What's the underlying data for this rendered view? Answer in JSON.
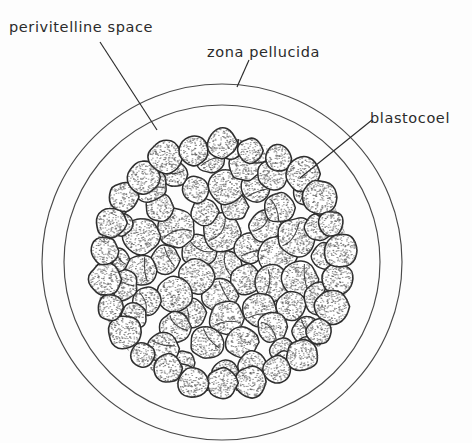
{
  "figure": {
    "background_color": "#fdfdfd",
    "ink_color": "#2b2b2b",
    "line_color": "#4a4a4a",
    "cell_outline_color": "#2e2e2e",
    "stipple_color": "#555555"
  },
  "labels": {
    "perivitelline_space": "perivitelline space",
    "zona_pellucida": "zona pellucida",
    "blastocoel": "blastocoel"
  },
  "structures": {
    "zona_outer": {
      "name": "zona pellucida outer boundary",
      "cx": 222,
      "cy": 262,
      "rx": 180,
      "ry": 178
    },
    "zona_inner": {
      "name": "zona pellucida inner boundary",
      "cx": 222,
      "cy": 262,
      "rx": 158,
      "ry": 157
    },
    "cell_mass": {
      "name": "blastomere cell mass",
      "cx": 222,
      "cy": 265,
      "r": 127,
      "cell_count": 86,
      "cell_radius_min": 13,
      "cell_radius_max": 20
    }
  },
  "leaders": [
    {
      "name": "perivitelline-leader",
      "x1": 100,
      "y1": 42,
      "x2": 157,
      "y2": 130
    },
    {
      "name": "zona-leader",
      "x1": 249,
      "y1": 60,
      "x2": 237,
      "y2": 87
    },
    {
      "name": "blastocoel-leader",
      "x1": 372,
      "y1": 120,
      "x2": 300,
      "y2": 178
    }
  ]
}
